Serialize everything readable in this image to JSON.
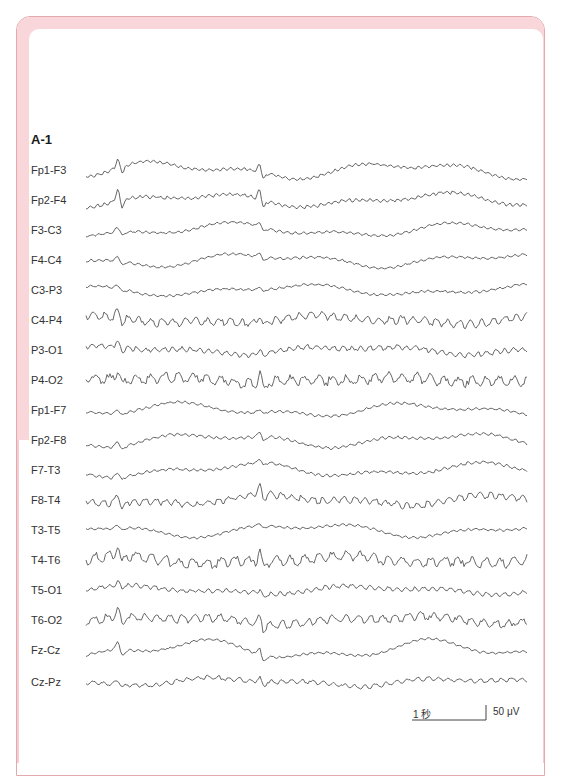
{
  "figure": {
    "panel_label": "A-1",
    "trace_color": "#555555",
    "frame_color": "#f8d6da",
    "frame_outline_color": "#e4a9af",
    "channels": [
      {
        "label": "Fp1-F3",
        "y": 170
      },
      {
        "label": "Fp2-F4",
        "y": 200
      },
      {
        "label": "F3-C3",
        "y": 230
      },
      {
        "label": "F4-C4",
        "y": 260
      },
      {
        "label": "C3-P3",
        "y": 290
      },
      {
        "label": "C4-P4",
        "y": 320
      },
      {
        "label": "P3-O1",
        "y": 350
      },
      {
        "label": "P4-O2",
        "y": 380
      },
      {
        "label": "Fp1-F7",
        "y": 410
      },
      {
        "label": "Fp2-F8",
        "y": 440
      },
      {
        "label": "F7-T3",
        "y": 470
      },
      {
        "label": "F8-T4",
        "y": 500
      },
      {
        "label": "T3-T5",
        "y": 530
      },
      {
        "label": "T4-T6",
        "y": 560
      },
      {
        "label": "T5-O1",
        "y": 590
      },
      {
        "label": "T6-O2",
        "y": 620
      },
      {
        "label": "Fz-Cz",
        "y": 650
      },
      {
        "label": "Cz-Pz",
        "y": 682
      }
    ],
    "scale_bar": {
      "time_label": "1 秒",
      "amplitude_label": "50 μV"
    }
  }
}
